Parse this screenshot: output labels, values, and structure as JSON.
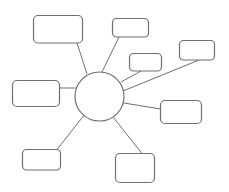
{
  "diagram": {
    "type": "spider-diagram",
    "width": 229,
    "height": 192,
    "colors": {
      "background": "#ffffff",
      "stroke": "#707070",
      "connector": "#6f6f6f"
    },
    "hub": {
      "label": "",
      "cx": 99.5,
      "cy": 96.5,
      "r": 24.5
    },
    "nodes": [
      {
        "id": "top-left",
        "label": "",
        "x": 33.5,
        "y": 15.5,
        "w": 49,
        "h": 27.5,
        "rx": 4.5,
        "line": {
          "x1": 77,
          "y1": 43,
          "x2": 87,
          "y2": 74
        }
      },
      {
        "id": "top-middle",
        "label": "",
        "x": 112.5,
        "y": 18.5,
        "w": 36,
        "h": 18.5,
        "rx": 4,
        "line": {
          "x1": 119,
          "y1": 37,
          "x2": 102,
          "y2": 72
        }
      },
      {
        "id": "small-middle",
        "label": "",
        "x": 129.5,
        "y": 53.5,
        "w": 32,
        "h": 17.5,
        "rx": 4,
        "line": {
          "x1": 141,
          "y1": 71,
          "x2": 121,
          "y2": 82
        }
      },
      {
        "id": "far-right",
        "label": "",
        "x": 179.5,
        "y": 40.5,
        "w": 35,
        "h": 19.5,
        "rx": 4,
        "line": {
          "x1": 199,
          "y1": 60,
          "x2": 123,
          "y2": 91
        }
      },
      {
        "id": "left",
        "label": "",
        "x": 12.5,
        "y": 80.5,
        "w": 47,
        "h": 26,
        "rx": 4.5,
        "line": {
          "x1": 59.5,
          "y1": 88,
          "x2": 75.5,
          "y2": 88
        }
      },
      {
        "id": "right",
        "label": "",
        "x": 160.5,
        "y": 100.5,
        "w": 41,
        "h": 23,
        "rx": 4.5,
        "line": {
          "x1": 124,
          "y1": 103,
          "x2": 160.5,
          "y2": 109
        }
      },
      {
        "id": "bottom-left",
        "label": "",
        "x": 22.5,
        "y": 149.5,
        "w": 38,
        "h": 20.5,
        "rx": 4,
        "line": {
          "x1": 85,
          "y1": 114,
          "x2": 57,
          "y2": 149.5
        }
      },
      {
        "id": "bottom-middle",
        "label": "",
        "x": 115.5,
        "y": 153.5,
        "w": 39,
        "h": 29,
        "rx": 4.5,
        "line": {
          "x1": 113,
          "y1": 117,
          "x2": 142,
          "y2": 153.5
        }
      }
    ]
  }
}
